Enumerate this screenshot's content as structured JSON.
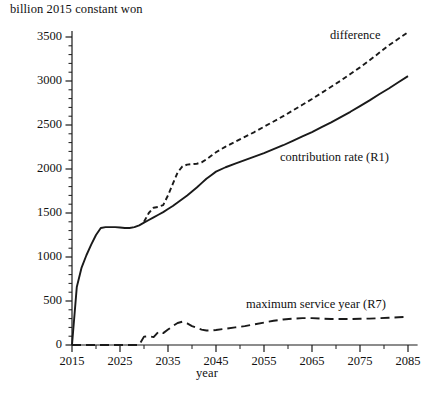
{
  "chart_data": {
    "type": "line",
    "title": "",
    "ylabel": "billion 2015 constant won",
    "xlabel": "year",
    "xlim": [
      2015,
      2087
    ],
    "ylim": [
      0,
      3600
    ],
    "grid": false,
    "legend_position": "inline-annotations",
    "y_ticks": [
      0,
      500,
      1000,
      1500,
      2000,
      2500,
      3000,
      3500
    ],
    "y_tick_labels": [
      "0",
      "500",
      "1000",
      "1500",
      "2000",
      "2500",
      "3000",
      "3500"
    ],
    "y_minor_tick_interval": 100,
    "x_ticks": [
      2015,
      2025,
      2035,
      2045,
      2055,
      2065,
      2075,
      2085
    ],
    "x_tick_labels": [
      "2015",
      "2025",
      "2035",
      "2045",
      "2055",
      "2065",
      "2075",
      "2085"
    ],
    "x_minor_tick_interval": 5,
    "series": [
      {
        "name": "contribution rate (R1)",
        "style": "solid",
        "label_text": "contribution rate (R1)",
        "x": [
          2015,
          2016,
          2017,
          2018,
          2019,
          2020,
          2021,
          2022,
          2023,
          2024,
          2025,
          2026,
          2027,
          2028,
          2029,
          2030,
          2031,
          2032,
          2033,
          2034,
          2035,
          2036,
          2037,
          2038,
          2039,
          2040,
          2041,
          2042,
          2043,
          2044,
          2045,
          2047,
          2049,
          2051,
          2053,
          2055,
          2057,
          2059,
          2061,
          2063,
          2065,
          2067,
          2069,
          2071,
          2073,
          2075,
          2077,
          2079,
          2081,
          2083,
          2085
        ],
        "values": [
          0,
          660,
          880,
          1020,
          1140,
          1250,
          1330,
          1340,
          1340,
          1340,
          1335,
          1330,
          1330,
          1340,
          1360,
          1390,
          1420,
          1450,
          1480,
          1510,
          1545,
          1580,
          1620,
          1660,
          1700,
          1745,
          1790,
          1840,
          1890,
          1930,
          1970,
          2020,
          2060,
          2100,
          2140,
          2180,
          2225,
          2270,
          2320,
          2370,
          2420,
          2475,
          2530,
          2590,
          2650,
          2715,
          2780,
          2850,
          2915,
          2985,
          3055
        ]
      },
      {
        "name": "difference",
        "style": "dotted",
        "label_text": "difference",
        "x": [
          2030,
          2031,
          2032,
          2033,
          2034,
          2035,
          2036,
          2037,
          2038,
          2039,
          2040,
          2041,
          2042,
          2043,
          2044,
          2045,
          2047,
          2049,
          2051,
          2053,
          2055,
          2057,
          2059,
          2061,
          2063,
          2065,
          2067,
          2069,
          2071,
          2073,
          2075,
          2077,
          2079,
          2081,
          2083,
          2085
        ],
        "values": [
          1400,
          1500,
          1560,
          1570,
          1590,
          1700,
          1830,
          1960,
          2030,
          2050,
          2055,
          2060,
          2075,
          2110,
          2150,
          2190,
          2255,
          2310,
          2365,
          2420,
          2480,
          2540,
          2600,
          2665,
          2730,
          2795,
          2865,
          2935,
          3005,
          3080,
          3155,
          3235,
          3320,
          3405,
          3480,
          3555
        ]
      },
      {
        "name": "maximum service year (R7)",
        "style": "dashed",
        "label_text": "maximum service year (R7)",
        "x": [
          2015,
          2020,
          2025,
          2029,
          2030,
          2031,
          2032,
          2033,
          2034,
          2035,
          2036,
          2037,
          2038,
          2039,
          2040,
          2041,
          2042,
          2043,
          2044,
          2045,
          2047,
          2049,
          2051,
          2053,
          2055,
          2057,
          2059,
          2061,
          2063,
          2065,
          2067,
          2069,
          2071,
          2073,
          2075,
          2077,
          2079,
          2081,
          2083,
          2085
        ],
        "values": [
          0,
          0,
          0,
          0,
          95,
          100,
          90,
          150,
          135,
          175,
          215,
          250,
          265,
          245,
          215,
          195,
          175,
          165,
          165,
          170,
          185,
          200,
          215,
          235,
          255,
          275,
          290,
          300,
          305,
          305,
          300,
          295,
          295,
          295,
          298,
          300,
          305,
          310,
          315,
          320
        ]
      }
    ],
    "colors": {
      "line": "#1a1a1a",
      "axis": "#1a1a1a",
      "background": "#ffffff"
    }
  }
}
